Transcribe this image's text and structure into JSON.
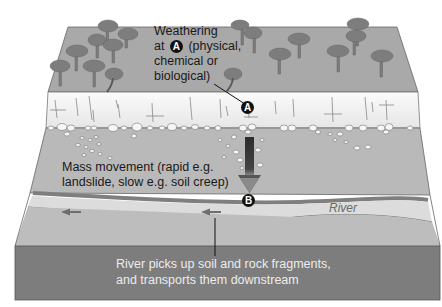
{
  "diagram": {
    "labels": {
      "weathering_line1": "Weathering",
      "weathering_line2_pre": "at",
      "weathering_marker": "A",
      "weathering_line2_post": "(physical,",
      "weathering_line3": "chemical or",
      "weathering_line4": "biological)",
      "mass_movement_line1": "Mass movement (rapid e.g.",
      "mass_movement_line2": "landslide, slow e.g. soil creep)",
      "river": "River",
      "transport_line1": "River picks up soil and rock fragments,",
      "transport_line2": "and transports them downstream"
    },
    "markers": [
      {
        "id": "A",
        "meaning": "weathering site"
      },
      {
        "id": "B",
        "meaning": "material reaches river"
      }
    ],
    "colors": {
      "top_surface": "#a9a9a9",
      "rock_band": "#f2f2f2",
      "slope": "#b8b8b8",
      "river_bank": "#8a8a8a",
      "river_water": "#dcdcdc",
      "front_face": "#7d7d7d",
      "tree": "#7a7a7a",
      "arrow": "#3a3a3a"
    }
  }
}
